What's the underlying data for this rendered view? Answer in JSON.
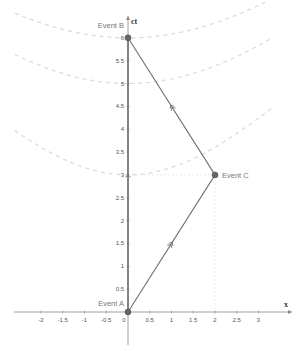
{
  "diagram": {
    "type": "spacetime-diagram",
    "axes": {
      "x_label": "x",
      "y_label": "ct",
      "x_ticks": [
        "-2",
        "-1.5",
        "-1",
        "-0.5",
        "0",
        "0.5",
        "1",
        "1.5",
        "2",
        "2.5",
        "3"
      ],
      "y_ticks": [
        "0.5",
        "1",
        "1.5",
        "2",
        "2.5",
        "3",
        "3.5",
        "4",
        "4.5",
        "5",
        "5.5",
        "6"
      ]
    },
    "events": [
      {
        "label": "Event A",
        "x": 0,
        "ct": 0
      },
      {
        "label": "Event B",
        "x": 0,
        "ct": 6
      },
      {
        "label": "Event C",
        "x": 2,
        "ct": 3
      }
    ],
    "worldlines": [
      {
        "from": "Event A",
        "to": "Event B",
        "arrow": "single"
      },
      {
        "from": "Event A",
        "to": "Event C",
        "arrow": "double"
      },
      {
        "from": "Event C",
        "to": "Event B",
        "arrow": "double"
      }
    ],
    "invariant_hyperbolae": [
      {
        "ct_intercept": 6
      },
      {
        "ct_intercept": 5
      },
      {
        "ct_intercept": 3
      }
    ],
    "colors": {
      "worldline": "#707070",
      "axis": "#888888",
      "hyperbola": "#d8d8d8",
      "point": "#666666",
      "guide": "#e6e6e6"
    }
  }
}
